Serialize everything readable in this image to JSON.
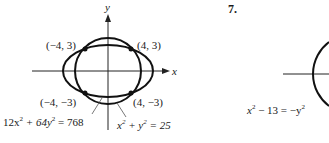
{
  "figure_left": {
    "axis_labels": {
      "x": "x",
      "y": "y"
    },
    "points": [
      "(−4, 3)",
      "(4, 3)",
      "(−4, −3)",
      "(4, −3)"
    ],
    "equation_ellipse": {
      "a": "12x",
      "b": "2",
      "c": " + 64y",
      "d": "2",
      "e": " = 768"
    },
    "equation_circle": {
      "a": "x",
      "b": "2",
      "c": " + y",
      "d": "2",
      "e": " = 25"
    }
  },
  "figure_right": {
    "problem_number": "7.",
    "equation": {
      "a": "x",
      "b": "2",
      "c": " − 13 = −y",
      "d": "2"
    }
  }
}
